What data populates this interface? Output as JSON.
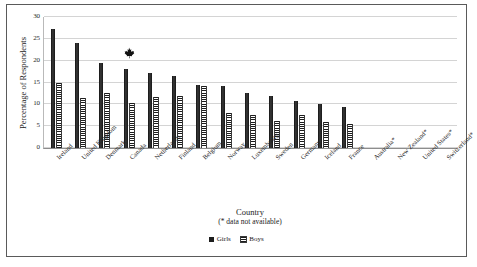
{
  "chart_data": {
    "type": "bar",
    "title": "",
    "xlabel": "Country",
    "xlabel_note": "(* data not available)",
    "ylabel": "Percentage of Respondents",
    "ylim": [
      0,
      30
    ],
    "ytick_step": 5,
    "yticks": [
      0,
      5,
      10,
      15,
      20,
      25,
      30
    ],
    "grid": true,
    "legend_position": "bottom",
    "categories": [
      "Ireland",
      "United Kingdom",
      "Denmark",
      "Canada",
      "Netherlands",
      "Finland",
      "Belgium",
      "Norway",
      "Luxembourg",
      "Sweden",
      "Germany",
      "Iceland",
      "France",
      "Australia*",
      "New Zealand*",
      "United States*",
      "Switzerland*"
    ],
    "series": [
      {
        "name": "Girls",
        "color": "#1d1d1d",
        "fill": "solid",
        "values": [
          27.3,
          24.1,
          19.5,
          18.1,
          17.2,
          16.5,
          14.5,
          14.1,
          12.7,
          11.8,
          10.8,
          10.0,
          9.3,
          null,
          null,
          null,
          null
        ]
      },
      {
        "name": "Boys",
        "color": "#1d1d1d",
        "fill": "horizontal-hatch",
        "values": [
          14.8,
          11.5,
          12.7,
          10.2,
          11.6,
          11.8,
          14.2,
          8.0,
          7.6,
          6.2,
          7.5,
          6.0,
          5.5,
          null,
          null,
          null,
          null
        ]
      }
    ],
    "annotations": [
      {
        "name": "maple-leaf-marker",
        "category": "Canada",
        "icon": "maple-leaf-icon",
        "value": 21.5
      }
    ]
  },
  "legend": {
    "entries": [
      {
        "label": "Girls",
        "swatch": "solid-black-square"
      },
      {
        "label": "Boys",
        "swatch": "hatched-square"
      }
    ]
  }
}
